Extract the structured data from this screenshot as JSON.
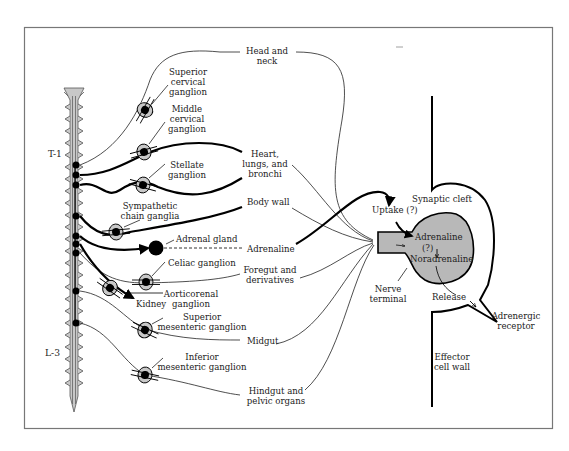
{
  "figure": {
    "frame_color": "#777777",
    "spine_fill": "#c8c8c8",
    "terminal_fill": "#b8b8b8",
    "ink": "#000000"
  },
  "spine": {
    "level_top": "T-1",
    "level_bottom": "L-3"
  },
  "ganglia": {
    "superior_cervical": [
      "Superior",
      "cervical",
      "ganglion"
    ],
    "middle_cervical": [
      "Middle",
      "cervical",
      "ganglion"
    ],
    "stellate": [
      "Stellate",
      "ganglion"
    ],
    "sympathetic_chain": [
      "Sympathetic",
      "chain ganglia"
    ],
    "adrenal_gland": "Adrenal gland",
    "celiac": "Celiac ganglion",
    "aorticorenal": [
      "Aorticorenal",
      "ganglion"
    ],
    "kidney": "Kidney",
    "superior_mesenteric": [
      "Superior",
      "mesenteric ganglion"
    ],
    "inferior_mesenteric": [
      "Inferior",
      "mesenteric ganglion"
    ]
  },
  "targets": {
    "head_neck": [
      "Head and",
      "neck"
    ],
    "heart": [
      "Heart,",
      "lungs, and",
      "bronchi"
    ],
    "body_wall": "Body wall",
    "adrenaline": "Adrenaline",
    "foregut": [
      "Foregut and",
      "derivatives"
    ],
    "midgut": "Midgut",
    "hindgut": [
      "Hindgut and",
      "pelvic organs"
    ]
  },
  "synapse": {
    "cleft": "Synaptic cleft",
    "uptake": "Uptake (?)",
    "adrenaline": "Adrenaline",
    "conversion": "(?)",
    "noradrenaline": "Noradrenaline",
    "nerve_terminal": [
      "Nerve",
      "terminal"
    ],
    "release": "Release",
    "receptor": [
      "Adrenergic",
      "receptor"
    ],
    "effector": [
      "Effector",
      "cell wall"
    ]
  }
}
